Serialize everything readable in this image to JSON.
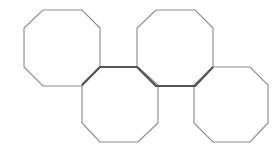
{
  "diagram": {
    "colors": {
      "background": "#ffffff",
      "outline": "#8a8a8a",
      "highlight": "#555555"
    },
    "octagons": [
      {
        "id": "octagon-1",
        "points": "43,10 82,10 100,28 100,67 82,86 43,86 24,67 24,28"
      },
      {
        "id": "octagon-2",
        "points": "100,67 138,67 158,85 158,123 138,142 100,142 82,123 82,85"
      },
      {
        "id": "octagon-3",
        "points": "156,10 195,10 213,28 213,67 195,86 156,86 137,67 137,28"
      },
      {
        "id": "octagon-4",
        "points": "213,67 250,67 268,85 268,123 250,142 213,142 194,123 194,85"
      }
    ],
    "highlight_path": "82,85 100,67 137,67 156,86 195,86 213,67"
  }
}
